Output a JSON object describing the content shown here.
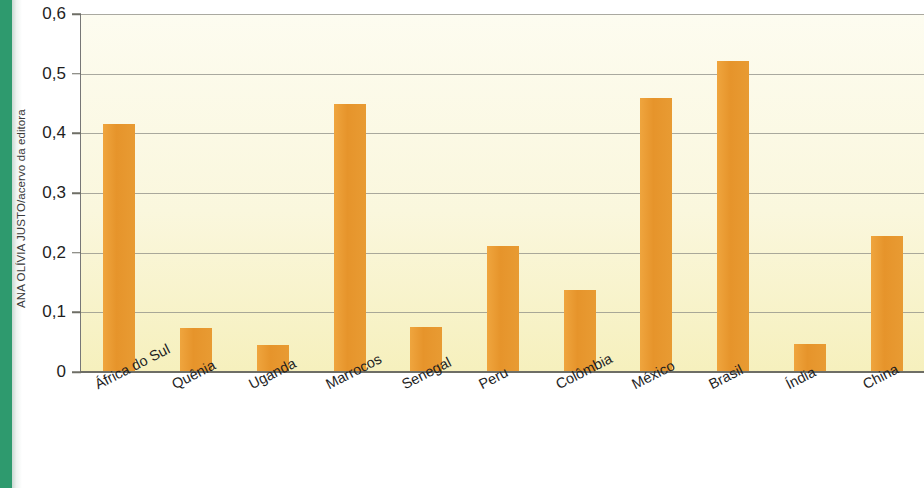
{
  "credit": {
    "text": "ANA OLÍVIA JUSTO/acervo da editora"
  },
  "chart_data": {
    "type": "bar",
    "title": "",
    "subtitle": "",
    "xlabel": "",
    "ylabel": "",
    "ylim": [
      0,
      0.6
    ],
    "ytick_step": 0.1,
    "grid": true,
    "legend": "none",
    "bar_color": "#e89b33",
    "plot_background_top": "#fdfcf0",
    "plot_background_bottom": "#f6f0bd",
    "gridline_color": "#8e8e86",
    "axis_color": "#6e6e66",
    "ytick_labels": [
      "0,6",
      "0,5",
      "0,4",
      "0,3",
      "0,2",
      "0,1",
      "0"
    ],
    "ytick_values": [
      0.6,
      0.5,
      0.4,
      0.3,
      0.2,
      0.1,
      0
    ],
    "categories": [
      "África do Sul",
      "Quênia",
      "Uganda",
      "Marrocos",
      "Senegal",
      "Peru",
      "Colômbia",
      "México",
      "Brasil",
      "Índia",
      "China"
    ],
    "values": [
      0.415,
      0.073,
      0.045,
      0.45,
      0.075,
      0.212,
      0.138,
      0.46,
      0.522,
      0.047,
      0.228
    ]
  }
}
